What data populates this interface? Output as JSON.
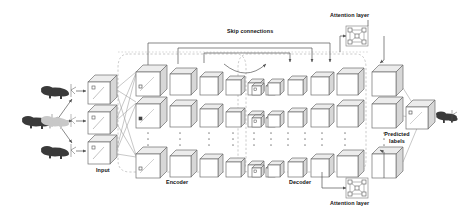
{
  "diagram": {
    "labels": {
      "input": "Input",
      "encoder": "Encoder",
      "decoder": "Decoder",
      "skip_connections": "Skip connections",
      "attention_top": "Attention layer",
      "attention_bottom": "Attention layer",
      "predicted_labels_line1": "Predicted",
      "predicted_labels_line2": "labels"
    },
    "colors": {
      "stroke": "#6f6f6f",
      "cube_face": "#ffffff",
      "cube_side": "#d7d7d7",
      "cube_top": "#ececec",
      "dashed": "#b5b5b5",
      "shape_dark": "#3a3a3a",
      "shape_mid": "#8e8e8e",
      "shape_light": "#c8c8c8",
      "text": "#111111",
      "background": "#ffffff"
    },
    "source_shapes": [
      {
        "name": "source-point-cloud",
        "tone": "shape_dark"
      }
    ],
    "augmented_shapes": [
      {
        "name": "augmented-shape-top",
        "tone": "shape_dark"
      },
      {
        "name": "augmented-shape-mid",
        "tone": "shape_light"
      },
      {
        "name": "augmented-shape-bottom",
        "tone": "shape_dark"
      }
    ],
    "input_cubes": [
      {
        "name": "input-cube-1"
      },
      {
        "name": "input-cube-2"
      },
      {
        "name": "input-cube-3"
      }
    ],
    "encoder_sizes": [
      34,
      28,
      24,
      19,
      15,
      11
    ],
    "decoder_sizes": [
      11,
      15,
      19,
      24,
      28,
      34
    ],
    "rows": 3,
    "ellipsis_columns": 11,
    "ellipsis_dots_per_column": 3,
    "attention_graph_nodes": 4,
    "output_shape": {
      "name": "predicted-shape",
      "tone": "shape_dark"
    }
  }
}
